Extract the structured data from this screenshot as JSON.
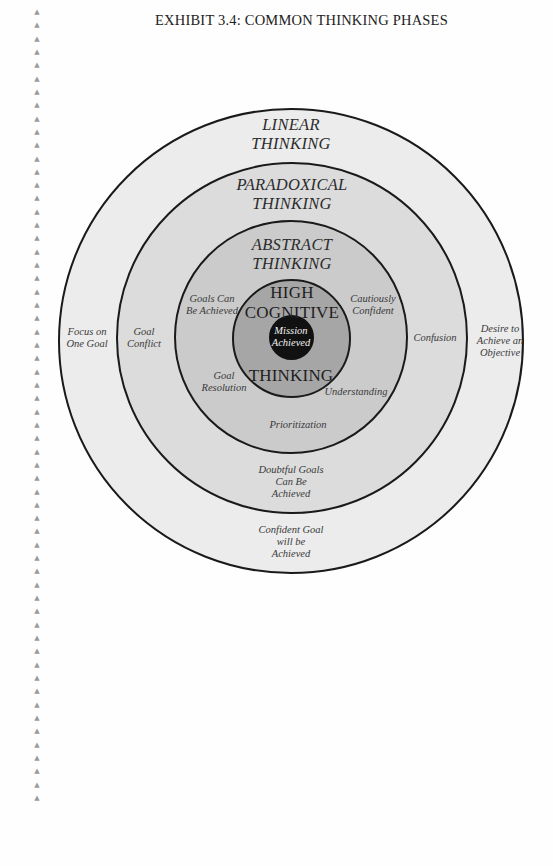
{
  "exhibit": {
    "title": "EXHIBIT 3.4:  COMMON THINKING PHASES"
  },
  "margin": {
    "marker_glyph": "▲",
    "marker_count": 60
  },
  "diagram": {
    "type": "concentric-circles",
    "rings": [
      {
        "name": "LINEAR THINKING",
        "title_lines": [
          "LINEAR",
          "THINKING"
        ],
        "fill": "#ececec",
        "left_label": [
          "Focus on",
          "One Goal"
        ],
        "right_label": [
          "Desire to",
          "Achieve an",
          "Objective"
        ],
        "bottom_label": [
          "Confident Goal",
          "will be",
          "Achieved"
        ]
      },
      {
        "name": "PARADOXICAL THINKING",
        "title_lines": [
          "PARADOXICAL",
          "THINKING"
        ],
        "fill": "#dcdcdc",
        "left_label": [
          "Goal",
          "Conflict"
        ],
        "right_label": [
          "Confusion"
        ],
        "bottom_label": [
          "Doubtful Goals",
          "Can Be",
          "Achieved"
        ]
      },
      {
        "name": "ABSTRACT THINKING",
        "title_lines": [
          "ABSTRACT",
          "THINKING"
        ],
        "fill": "#cbcbcb",
        "upper_left_label": [
          "Goals Can",
          "Be Achieved"
        ],
        "upper_right_label": [
          "Cautiously",
          "Confident"
        ],
        "lower_left_label": [
          "Goal",
          "Resolution"
        ],
        "lower_right_label": [
          "Understanding"
        ],
        "bottom_label": [
          "Prioritization"
        ]
      },
      {
        "name": "HIGH COGNITIVE THINKING",
        "title_lines": [
          "HIGH",
          "COGNITIVE"
        ],
        "bottom_title": "THINKING",
        "fill": "#a9a9a9"
      },
      {
        "name": "Mission Achieved",
        "title_lines": [
          "Mission",
          "Achieved"
        ],
        "fill": "#111111"
      }
    ]
  }
}
